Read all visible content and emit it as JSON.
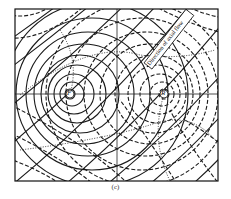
{
  "figure": {
    "caption": "(c)",
    "annotation": "Direction of axial flow",
    "poles": [
      {
        "label": "F",
        "x": 70,
        "y": 94
      },
      {
        "label": "R",
        "x": 164,
        "y": 94
      }
    ],
    "colors": {
      "ink": "#1a1a1a",
      "background": "#ffffff"
    }
  }
}
